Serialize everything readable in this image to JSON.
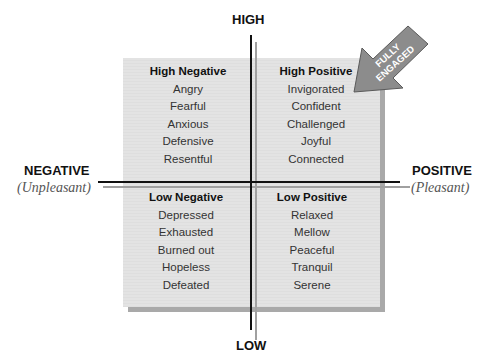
{
  "axes": {
    "top": {
      "label": "HIGH"
    },
    "bottom": {
      "label": "LOW"
    },
    "left": {
      "label": "NEGATIVE",
      "sublabel": "Unpleasant"
    },
    "right": {
      "label": "POSITIVE",
      "sublabel": "Pleasant"
    }
  },
  "quadrants": {
    "high_negative": {
      "title": "High Negative",
      "items": [
        "Angry",
        "Fearful",
        "Anxious",
        "Defensive",
        "Resentful"
      ]
    },
    "high_positive": {
      "title": "High Positive",
      "items": [
        "Invigorated",
        "Confident",
        "Challenged",
        "Joyful",
        "Connected"
      ]
    },
    "low_negative": {
      "title": "Low Negative",
      "items": [
        "Depressed",
        "Exhausted",
        "Burned out",
        "Hopeless",
        "Defeated"
      ]
    },
    "low_positive": {
      "title": "Low Positive",
      "items": [
        "Relaxed",
        "Mellow",
        "Peaceful",
        "Tranquil",
        "Serene"
      ]
    }
  },
  "callout": {
    "line1": "FULLY",
    "line2": "ENGAGED",
    "color": "#8c8c8c"
  },
  "colors": {
    "box_fill": "#e2e2e2",
    "box_shadow": "#a9a9a9",
    "axis": "#111111",
    "axis_shadow": "#a0a0a0"
  }
}
